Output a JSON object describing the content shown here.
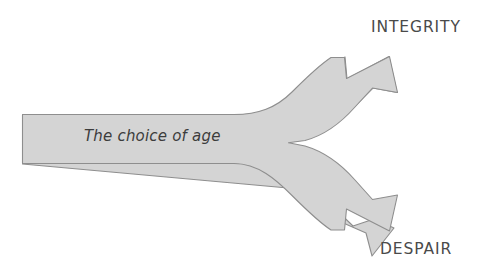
{
  "diagram": {
    "type": "fork-arrow-diagram",
    "background_color": "#ffffff",
    "arrow": {
      "name": "split-arrow",
      "fill_color": "#d4d4d4",
      "stroke_color": "#8e8e8e",
      "source_label": "The choice of age",
      "branches": [
        {
          "direction": "up-right",
          "label": "INTEGRITY"
        },
        {
          "direction": "down-right",
          "label": "DESPAIR"
        }
      ]
    },
    "labels": {
      "source": "The choice of age",
      "outcome_top": "INTEGRITY",
      "outcome_bottom": "DESPAIR"
    },
    "text_color": "#4a4a4a"
  }
}
